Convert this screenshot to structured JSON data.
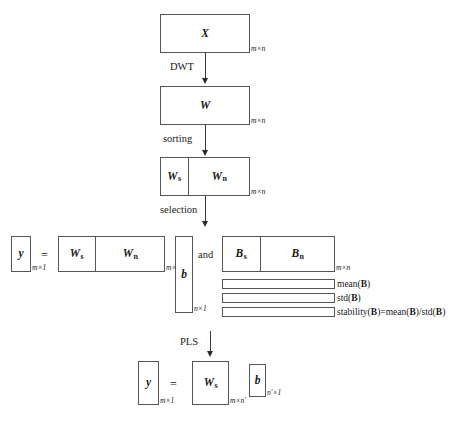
{
  "diagram": {
    "nodes": {
      "x_matrix": {
        "label": "X",
        "dim": "m×n"
      },
      "w_matrix": {
        "label": "W",
        "dim": "m×n"
      },
      "w_split": {
        "left_label": "W",
        "left_sub": "s",
        "right_label": "W",
        "right_sub": "n",
        "dim": "m×n"
      },
      "eq_y": {
        "label": "y",
        "dim": "m×1"
      },
      "eq_equals": "=",
      "eq_w": {
        "left_label": "W",
        "left_sub": "s",
        "right_label": "W",
        "right_sub": "n",
        "dim": "m×n"
      },
      "eq_b": {
        "label": "b",
        "dim": "n×1"
      },
      "conj": "and",
      "b_split": {
        "left_label": "B",
        "left_sub": "s",
        "right_label": "B",
        "right_sub": "n",
        "dim": "m×n"
      },
      "final_y": {
        "label": "y",
        "dim": "m×1"
      },
      "final_equals": "=",
      "final_w": {
        "label": "W",
        "sub": "s",
        "dim": "m×n′"
      },
      "final_b": {
        "label": "b",
        "dim": "n′×1"
      }
    },
    "processes": {
      "dwt": "DWT",
      "sorting": "sorting",
      "selection": "selection",
      "pls": "PLS"
    },
    "stats_rows": [
      {
        "name": "mean-row",
        "text_pre": "mean(",
        "text_bold": "B",
        "text_post": ")"
      },
      {
        "name": "std-row",
        "text_pre": "std(",
        "text_bold": "B",
        "text_post": ")"
      },
      {
        "name": "stability-row",
        "full": "stability(B)=mean(B)/std(B)"
      }
    ],
    "stats_labels": {
      "mean": "mean(B)",
      "std": "std(B)",
      "stability": "stability(B)=mean(B)/std(B)"
    },
    "colors": {
      "stroke": "#55565a",
      "arrow": "#2a2a2a",
      "text": "#1a1a1a",
      "background": "#ffffff"
    }
  }
}
